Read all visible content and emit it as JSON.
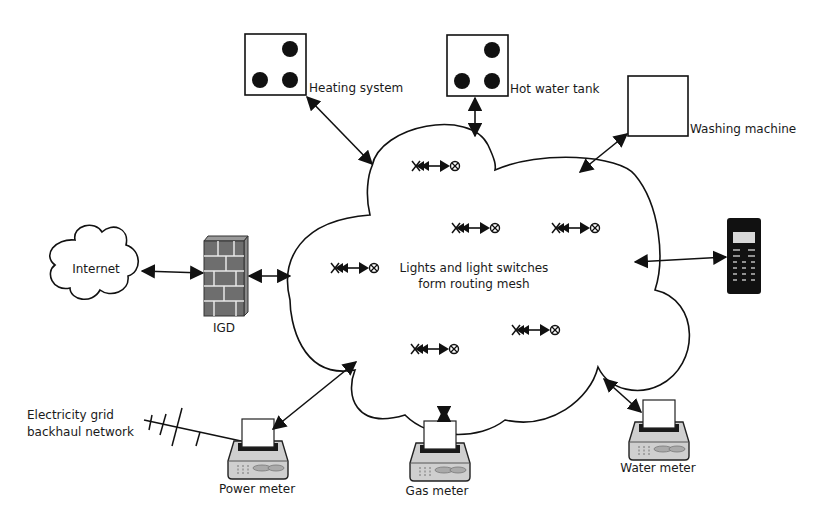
{
  "diagram": {
    "center_cloud": {
      "line1": "Lights and light switches",
      "line2": "form routing mesh"
    },
    "nodes": {
      "heating": "Heating system",
      "hot_water": "Hot water tank",
      "washing": "Washing machine",
      "internet": "Internet",
      "igd": "IGD",
      "phone": "",
      "power_meter": "Power meter",
      "gas_meter": "Gas meter",
      "water_meter": "Water meter",
      "grid_line1": "Electricity grid",
      "grid_line2": "backhaul network"
    },
    "icons": {
      "heating": "device-box-three-dots-icon",
      "hot_water": "device-box-three-dots-icon",
      "washing": "device-box-empty-icon",
      "internet": "cloud-icon",
      "igd": "brick-firewall-icon",
      "phone": "mobile-phone-icon",
      "meters": "meter-device-icon",
      "mesh_node": "switch-to-light-icon",
      "antenna": "antenna-icon"
    },
    "mesh_node_count": 6,
    "colors": {
      "line": "#111111",
      "background": "#ffffff",
      "firewall": "#6e6e6e",
      "meter_body": "#c8c8c8"
    }
  }
}
